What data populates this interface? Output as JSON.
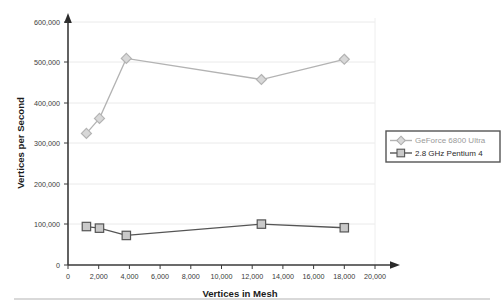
{
  "chart_data": {
    "type": "line",
    "title": "",
    "xlabel": "Vertices in Mesh",
    "ylabel": "Vertices per Second",
    "xlim": [
      0,
      20000
    ],
    "ylim": [
      0,
      600000
    ],
    "grid": true,
    "grid_axis": "y",
    "legend_position": "right",
    "x_ticks": [
      0,
      2000,
      4000,
      6000,
      8000,
      10000,
      12000,
      14000,
      16000,
      18000,
      20000
    ],
    "x_tick_labels": [
      "0",
      "2,000",
      "4,000",
      "6,000",
      "8,000",
      "10,000",
      "12,000",
      "14,000",
      "16,000",
      "18,000",
      "20,000"
    ],
    "y_ticks": [
      0,
      100000,
      200000,
      300000,
      400000,
      500000,
      600000
    ],
    "y_tick_labels": [
      "0",
      "100,000",
      "200,000",
      "300,000",
      "400,000",
      "500,000",
      "600,000"
    ],
    "x": [
      1200,
      2050,
      3800,
      12600,
      18000
    ],
    "series": [
      {
        "name": "GeForce 6800 Ultra",
        "marker": "diamond",
        "color": "#b3b3b3",
        "values": [
          325000,
          362000,
          510000,
          458000,
          508000
        ]
      },
      {
        "name": "2.8 GHz Pentium 4",
        "marker": "square",
        "color": "#555555",
        "values": [
          95000,
          91000,
          73000,
          101000,
          92000
        ]
      }
    ]
  },
  "legend": {
    "entries": [
      {
        "label": "GeForce 6800 Ultra"
      },
      {
        "label": "2.8 GHz Pentium 4"
      }
    ]
  },
  "colors": {
    "gpu_series": "#b3b3b3",
    "cpu_series": "#555555",
    "axis": "#3a3a3a",
    "grid": "#e8e8e8",
    "legend_border": "#555555",
    "footer_rule": "#cccccc"
  }
}
